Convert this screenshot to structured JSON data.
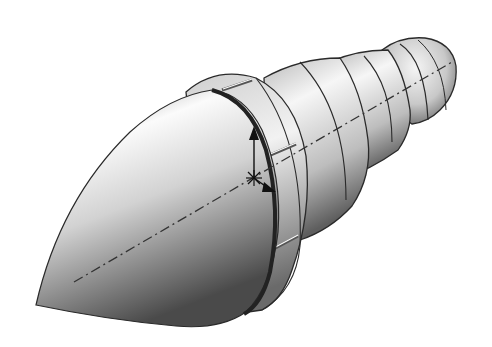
{
  "figure": {
    "background_color": "#ffffff",
    "shade_dark": "#3a3a3a",
    "shade_light": "#f4f4f4",
    "edge_color": "#2a2a2a",
    "features": [
      "ogive-nose",
      "flange-ring",
      "flange-notches",
      "conical-body",
      "stepped-shank",
      "rounded-end-cap",
      "centerline-axis",
      "coordinate-triad"
    ]
  }
}
